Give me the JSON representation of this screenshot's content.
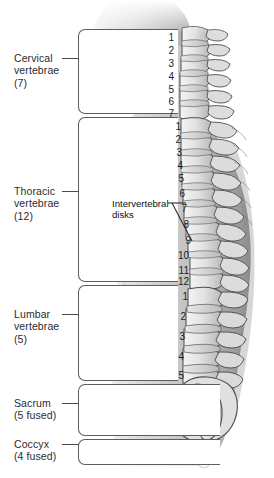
{
  "regions": [
    {
      "id": "cervical",
      "name": "Cervical",
      "line2": "vertebrae",
      "count": "(7)",
      "label": "Cervical\nvertebrae\n(7)"
    },
    {
      "id": "thoracic",
      "name": "Thoracic",
      "line2": "vertebrae",
      "count": "(12)",
      "label": "Thoracic\nvertebrae\n(12)"
    },
    {
      "id": "lumbar",
      "name": "Lumbar",
      "line2": "vertebrae",
      "count": "(5)",
      "label": "Lumbar\nvertebrae\n(5)"
    },
    {
      "id": "sacrum",
      "name": "Sacrum",
      "line2": "(5 fused)",
      "count": "",
      "label": "Sacrum\n(5 fused)"
    },
    {
      "id": "coccyx",
      "name": "Coccyx",
      "line2": "(4 fused)",
      "count": "",
      "label": "Coccyx\n(4 fused)"
    }
  ],
  "callout": {
    "label": "Intervertebral\ndisks"
  },
  "numbers": {
    "cervical": [
      "1",
      "2",
      "3",
      "4",
      "5",
      "6",
      "7"
    ],
    "thoracic": [
      "1",
      "2",
      "3",
      "4",
      "5",
      "6",
      "7",
      "8",
      "9",
      "10",
      "11",
      "12"
    ],
    "lumbar": [
      "1",
      "2",
      "3",
      "4",
      "5"
    ]
  },
  "colors": {
    "background": "#ffffff",
    "line": "#5d5d5d",
    "text": "#2b2b2b",
    "number": "#1d1d1d",
    "skin_light": "#d7d7d7",
    "skin_mid": "#bdbdbd",
    "skin_dark": "#9a9a9a",
    "bone_light": "#ededed",
    "bone_mid": "#cfcfcf",
    "bone_dark": "#8c8c8c",
    "bone_outline": "#4f4f4f"
  },
  "bottom_caption": ""
}
